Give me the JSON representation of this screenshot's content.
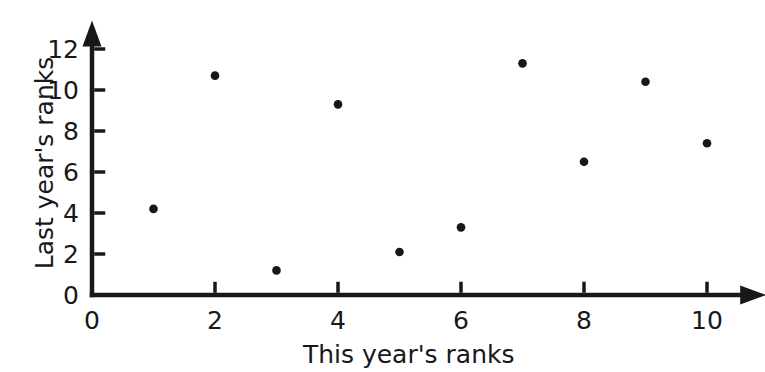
{
  "chart_data": {
    "type": "scatter",
    "title": "",
    "xlabel": "This year's ranks",
    "ylabel": "Last year's ranks",
    "xlim": [
      0,
      10.8
    ],
    "ylim": [
      0,
      12.9
    ],
    "grid": false,
    "legend": null,
    "x_ticks": [
      0,
      2,
      4,
      6,
      8,
      10
    ],
    "y_ticks": [
      0,
      2,
      4,
      6,
      8,
      10,
      12
    ],
    "x_tick_labels": [
      "0",
      "2",
      "4",
      "6",
      "8",
      "10"
    ],
    "y_tick_labels": [
      "0",
      "2",
      "4",
      "6",
      "8",
      "10",
      "12"
    ],
    "marker": "filled-circle",
    "marker_color": "#18181a",
    "axis_color": "#18181a",
    "background_color": "#ffffff",
    "x": [
      1,
      2,
      3,
      4,
      5,
      6,
      7,
      8,
      9,
      10
    ],
    "y": [
      4.2,
      10.7,
      1.2,
      9.3,
      2.1,
      3.3,
      11.3,
      6.5,
      10.4,
      7.4
    ],
    "points": [
      {
        "x": 1,
        "y": 4.2
      },
      {
        "x": 2,
        "y": 10.7
      },
      {
        "x": 3,
        "y": 1.2
      },
      {
        "x": 4,
        "y": 9.3
      },
      {
        "x": 5,
        "y": 2.1
      },
      {
        "x": 6,
        "y": 3.3
      },
      {
        "x": 7,
        "y": 11.3
      },
      {
        "x": 8,
        "y": 6.5
      },
      {
        "x": 9,
        "y": 10.4
      },
      {
        "x": 10,
        "y": 7.4
      }
    ]
  },
  "figure": {
    "origin_label": "0"
  }
}
